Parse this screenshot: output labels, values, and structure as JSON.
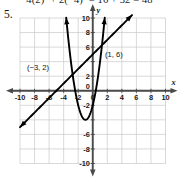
{
  "worked_solution": {
    "text": "4(2)² + 2(−4)² = 16 + 32 = 48"
  },
  "problem": {
    "number": "5."
  },
  "colors": {
    "grid": "#c9c9c9",
    "axis": "#4a4a4a",
    "curve": "#000000",
    "text": "#111111",
    "background": "#ffffff"
  },
  "chart_data": {
    "type": "line",
    "title": "",
    "xlabel": "x",
    "ylabel": "y",
    "xlim": [
      -10,
      10
    ],
    "ylim": [
      -10,
      10
    ],
    "grid": true,
    "grid_step": 2,
    "legend": "none",
    "x_ticks": [
      -10,
      -8,
      -6,
      -4,
      -2,
      0,
      2,
      4,
      6,
      8,
      10
    ],
    "y_ticks": [
      10,
      8,
      6,
      4,
      2,
      -2,
      -4,
      -6,
      -8,
      -10
    ],
    "x_tick_labels": [
      "-10",
      "-8",
      "-6",
      "-4",
      "-2",
      "0",
      "2",
      "4",
      "6",
      "8",
      "10"
    ],
    "y_tick_labels": [
      "10",
      "8",
      "6",
      "4",
      "2",
      "-2",
      "-4",
      "-6",
      "-8",
      "-10"
    ],
    "y_tick_labels_visible": [
      "10",
      "8",
      "6",
      "2",
      "-2",
      "-6",
      "-8",
      "-10"
    ],
    "series": [
      {
        "name": "line",
        "type": "line",
        "equation": "y = x + 5",
        "slope": 1,
        "intercept": 5,
        "arrows": [
          "start",
          "end"
        ],
        "points": [
          [
            -10,
            -5
          ],
          [
            5,
            10
          ]
        ]
      },
      {
        "name": "parabola",
        "type": "quadratic",
        "equation": "y = 2x² + 4x - 2",
        "vertex": [
          -1,
          -4
        ],
        "arrows": [
          "start",
          "end"
        ],
        "a": 2,
        "b": 4,
        "c": -2
      }
    ],
    "annotations": [
      {
        "label": "(−3, 2)",
        "x": -3,
        "y": 2,
        "label_dx": -44,
        "label_dy": -6
      },
      {
        "label": "(1, 6)",
        "x": 1,
        "y": 6,
        "label_dx": 5,
        "label_dy": 10
      }
    ],
    "intersections": [
      {
        "label": "(−3, 2)",
        "x": -3,
        "y": 2
      },
      {
        "label": "(1, 6)",
        "x": 1,
        "y": 6
      }
    ]
  }
}
